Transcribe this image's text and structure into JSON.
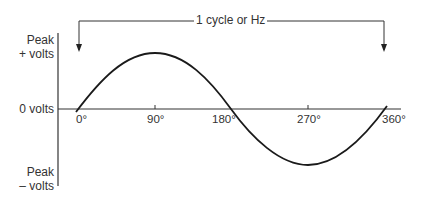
{
  "diagram": {
    "cycle_label": "1 cycle or Hz",
    "y_labels": {
      "peak_positive": [
        "Peak",
        "+ volts"
      ],
      "zero": "0 volts",
      "peak_negative": [
        "Peak",
        "– volts"
      ]
    },
    "x_ticks": [
      "0°",
      "90°",
      "180°",
      "270°",
      "360°"
    ],
    "colors": {
      "line": "#1a1a1a",
      "text": "#333333",
      "background": "#ffffff"
    }
  }
}
